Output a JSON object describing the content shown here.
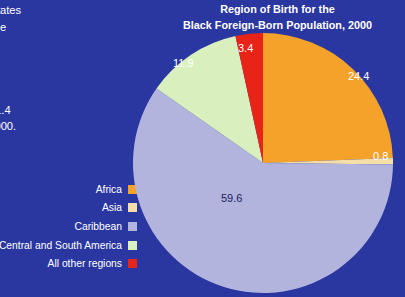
{
  "background_color": "#2b37a0",
  "body_copy": {
    "note": "paragraph text clipped by the left edge of the screenshot",
    "lines": [
      "United States",
      "cent of the",
      "e United",
      "arrived",
      "portion",
      "n arrived",
      "ted for 41.4",
      "e year 2000.",
      "pulation"
    ]
  },
  "chart_title": {
    "line1": "Region of Birth for the",
    "line2": "Black Foreign-Born Population, 2000"
  },
  "legend": {
    "items": [
      {
        "label": "Africa",
        "color": "#f5a22a"
      },
      {
        "label": "Asia",
        "color": "#f5dfa8"
      },
      {
        "label": "Caribbean",
        "color": "#b3b4de"
      },
      {
        "label": "Central and South America",
        "color": "#d9efbd"
      },
      {
        "label": "All other regions",
        "color": "#e82318"
      }
    ]
  },
  "chart_data": {
    "type": "pie",
    "title": "Region of Birth for the Black Foreign-Born Population, 2000",
    "units": "percent",
    "legend_position": "left",
    "start_angle_deg": -90,
    "direction": "clockwise",
    "categories": [
      "Africa",
      "Asia",
      "Caribbean",
      "Central and South America",
      "All other regions"
    ],
    "values": [
      24.4,
      0.8,
      59.6,
      11.9,
      3.4
    ],
    "colors": [
      "#f5a22a",
      "#f5dfa8",
      "#b3b4de",
      "#d9efbd",
      "#e82318"
    ],
    "labels": {
      "africa": "24.4",
      "asia": "0.8",
      "caribbean": "59.6",
      "central_and_south_america": "11.9",
      "all_other_regions": "3.4"
    },
    "label_colors": {
      "africa": "#ffffff",
      "asia": "#ffffff",
      "caribbean": "#16225e",
      "central_and_south_america": "#ffffff",
      "all_other_regions": "#ffffff"
    }
  }
}
